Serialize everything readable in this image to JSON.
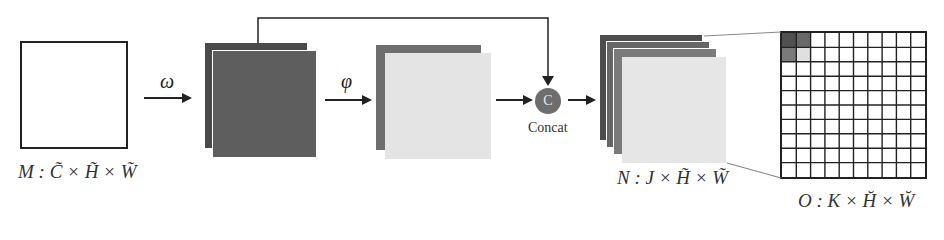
{
  "diagram": {
    "input": {
      "label": "M : C̃ × H̃ × W̃",
      "shape": "square",
      "fill": "#ffffff",
      "stroke": "#222222"
    },
    "op1": {
      "symbol": "ω"
    },
    "stage1": {
      "layers": [
        "#4a4a4a",
        "#5e5e5e"
      ]
    },
    "op2": {
      "symbol": "φ"
    },
    "stage2": {
      "layers": [
        "#6e6e6e",
        "#e4e4e4"
      ]
    },
    "concat": {
      "symbol": "C",
      "label": "Concat",
      "fill": "#6e6e6e"
    },
    "output_n": {
      "label": "N : J × H̃ × W̃",
      "layers": [
        "#4d4d4d",
        "#666666",
        "#7a7a7a",
        "#e6e6e6"
      ]
    },
    "output_o": {
      "label": "O : K × H̆ × W̆",
      "grid": {
        "rows": 10,
        "cols": 10
      },
      "highlighted_cells": [
        {
          "row": 0,
          "col": 0,
          "color": "#505050"
        },
        {
          "row": 0,
          "col": 1,
          "color": "#6a6a6a"
        },
        {
          "row": 1,
          "col": 0,
          "color": "#7a7a7a"
        },
        {
          "row": 1,
          "col": 1,
          "color": "#e0e0e0"
        }
      ]
    },
    "edges": [
      {
        "from": "input",
        "to": "stage1",
        "label": "ω"
      },
      {
        "from": "stage1",
        "to": "stage2",
        "label": "φ"
      },
      {
        "from": "stage2",
        "to": "concat"
      },
      {
        "from": "stage1",
        "to": "concat",
        "type": "skip"
      },
      {
        "from": "concat",
        "to": "output_n"
      },
      {
        "from": "output_n",
        "to": "output_o",
        "type": "zoom-projection"
      }
    ]
  }
}
